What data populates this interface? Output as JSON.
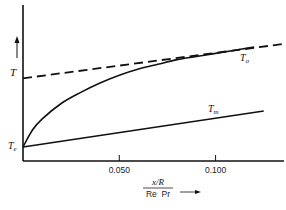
{
  "chart_data": {
    "type": "line",
    "title": "",
    "xlabel_numerator": "x/R",
    "xlabel_denominator": "Re  Pr",
    "ylabel": "T",
    "xlim": [
      0,
      0.135
    ],
    "ylim": [
      0,
      1
    ],
    "x_ticks": [
      {
        "value": 0.05,
        "label": "0.050"
      },
      {
        "value": 0.1,
        "label": "0.100"
      }
    ],
    "y_ticks": [],
    "grid": false,
    "series": [
      {
        "name": "T_o",
        "label": "T",
        "subscript": "o",
        "style": "dashed",
        "x": [
          0,
          0.135
        ],
        "y": [
          0.53,
          0.75
        ]
      },
      {
        "name": "wall-temperature-curve",
        "label": "",
        "style": "solid",
        "x": [
          0,
          0.005,
          0.01,
          0.02,
          0.03,
          0.04,
          0.05,
          0.06,
          0.07,
          0.08,
          0.09,
          0.1,
          0.11,
          0.12
        ],
        "y": [
          0.09,
          0.2,
          0.27,
          0.37,
          0.44,
          0.5,
          0.55,
          0.59,
          0.62,
          0.65,
          0.67,
          0.69,
          0.71,
          0.73
        ]
      },
      {
        "name": "T_m",
        "label": "T",
        "subscript": "m",
        "style": "solid",
        "x": [
          0,
          0.125
        ],
        "y": [
          0.09,
          0.32
        ]
      }
    ],
    "annotations": [
      {
        "text": "T",
        "subscript": "e",
        "x": 0,
        "y": 0.09,
        "position": "left"
      },
      {
        "text": "T",
        "subscript": "o",
        "x": 0.105,
        "y": 0.66
      },
      {
        "text": "T",
        "subscript": "m",
        "x": 0.097,
        "y": 0.33
      },
      {
        "text": "T",
        "x": 0,
        "y": 0.57,
        "position": "left-axis-label"
      }
    ],
    "legend": "none"
  }
}
